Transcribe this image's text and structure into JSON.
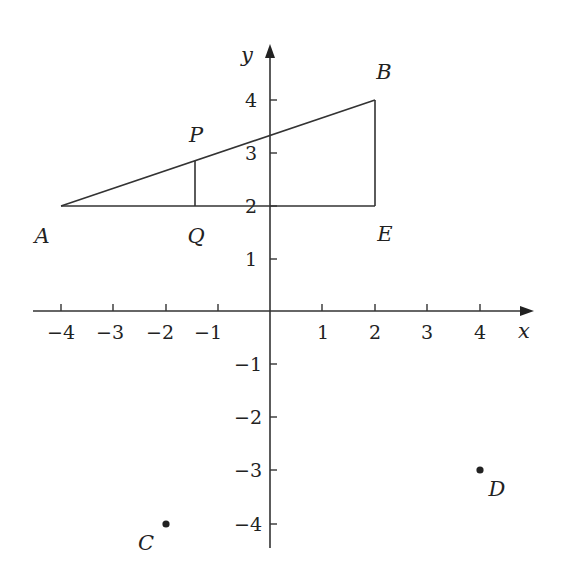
{
  "diagram": {
    "type": "coordinate-geometry",
    "axes": {
      "x_label": "x",
      "y_label": "y",
      "x_ticks": [
        "−4",
        "−3",
        "−2",
        "−1",
        "1",
        "2",
        "3",
        "4"
      ],
      "y_ticks": [
        "4",
        "3",
        "2",
        "1",
        "−1",
        "−2",
        "−3",
        "−4"
      ],
      "x_range": [
        -4.3,
        4.8
      ],
      "y_range": [
        -4.4,
        4.5
      ]
    },
    "points": {
      "A": {
        "label": "A",
        "x": -4,
        "y": 2
      },
      "B": {
        "label": "B",
        "x": 2,
        "y": 4
      },
      "E": {
        "label": "E",
        "x": 2,
        "y": 2
      },
      "P": {
        "label": "P",
        "x": -1.43,
        "y": 2.86
      },
      "Q": {
        "label": "Q",
        "x": -1.43,
        "y": 2
      },
      "C": {
        "label": "C",
        "x": -2,
        "y": -4
      },
      "D": {
        "label": "D",
        "x": 4,
        "y": -3
      }
    },
    "segments": [
      "AB",
      "AE",
      "BE",
      "PQ"
    ],
    "dots": [
      "C",
      "D"
    ]
  }
}
